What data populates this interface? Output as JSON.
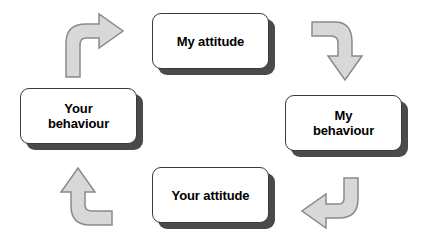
{
  "diagram": {
    "type": "cycle-diagram",
    "direction": "clockwise",
    "colors": {
      "box_fill": "#ffffff",
      "box_border": "#3a3a3a",
      "box_shadow": "#4a4a4a",
      "text": "#000000",
      "arrow_fill": "#d8d8d8",
      "arrow_stroke": "#8a8a8a",
      "background": "#ffffff"
    },
    "nodes": [
      {
        "id": "my-attitude",
        "label": "My attitude"
      },
      {
        "id": "my-behaviour",
        "label": "My\nbehaviour"
      },
      {
        "id": "your-attitude",
        "label": "Your attitude"
      },
      {
        "id": "your-behaviour",
        "label": "Your\nbehaviour"
      }
    ],
    "arrows": [
      {
        "id": "arrow-top-right",
        "from": "my-attitude",
        "to": "my-behaviour",
        "direction": "down"
      },
      {
        "id": "arrow-bottom-right",
        "from": "my-behaviour",
        "to": "your-attitude",
        "direction": "left"
      },
      {
        "id": "arrow-bottom-left",
        "from": "your-attitude",
        "to": "your-behaviour",
        "direction": "up"
      },
      {
        "id": "arrow-top-left",
        "from": "your-behaviour",
        "to": "my-attitude",
        "direction": "right"
      }
    ]
  }
}
